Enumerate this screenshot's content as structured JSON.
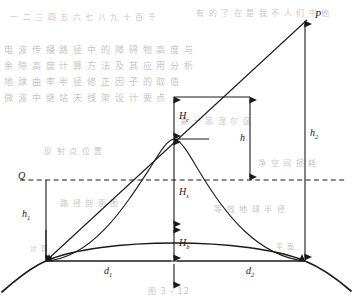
{
  "figure": {
    "type": "path-profile-diagram",
    "background_color": "#ffffff",
    "stroke_color": "#1a1a1a",
    "ghost_color": "#c8c6c4"
  },
  "labels": {
    "transmitter_apex": "P",
    "receiver_ref": "Q",
    "height_left": "h",
    "height_left_sub": "1",
    "height_right": "h",
    "height_right_sub": "2",
    "clearance": "H",
    "clearance_sub": "c",
    "sight_height": "H",
    "sight_height_sub": "s",
    "bulge_height": "H",
    "bulge_height_sub": "b",
    "obstacle_gap": "h",
    "distance_left": "d",
    "distance_left_sub": "1",
    "distance_right": "d",
    "distance_right_sub": "2"
  },
  "geometry": {
    "left_terminal": [
      46,
      261
    ],
    "right_terminal": [
      305,
      261
    ],
    "apex_p": [
      307,
      18
    ],
    "q_point": [
      46,
      180
    ],
    "center_x": 174,
    "terrain_peak": [
      174,
      139
    ],
    "bulge_peak": [
      174,
      227
    ],
    "dashed_line_y": 180,
    "bracket_x": 250,
    "bracket_top_y": 97,
    "los_tick_y": 97
  },
  "background_text": {
    "rows": [
      {
        "text": "一 二 三 四 五 六 七 八 九 十 百 千",
        "x": 10,
        "y": 14,
        "size": 8
      },
      {
        "text": "有 的 了 在 是 我 不 人 们 中 他",
        "x": 196,
        "y": 10,
        "size": 8
      },
      {
        "text": "电 波 传 播 路 径 中 的 障 碍 物 高 度 与",
        "x": 4,
        "y": 46,
        "size": 9
      },
      {
        "text": "余 隙 高 度 计 算 方 法 及 其 应 用 分 析",
        "x": 4,
        "y": 62,
        "size": 9
      },
      {
        "text": "地 球 曲 率 半 径 修 正 因 子 的 取 值",
        "x": 4,
        "y": 78,
        "size": 9
      },
      {
        "text": "微 波 中 继 站 天 线 架 设 计 要 点",
        "x": 4,
        "y": 94,
        "size": 9
      },
      {
        "text": "第 一 菲 涅 尔 区",
        "x": 180,
        "y": 118,
        "size": 8
      },
      {
        "text": "反 射 点 位 置",
        "x": 44,
        "y": 148,
        "size": 8
      },
      {
        "text": "净 空 间 损 耗",
        "x": 258,
        "y": 160,
        "size": 8
      },
      {
        "text": "路 径 剖 面 图",
        "x": 60,
        "y": 200,
        "size": 8
      },
      {
        "text": "等 效 地 球 半 径",
        "x": 214,
        "y": 206,
        "size": 8
      },
      {
        "text": "图 3 - 12",
        "x": 148,
        "y": 288,
        "size": 8
      },
      {
        "text": "计 算",
        "x": 30,
        "y": 246,
        "size": 7
      },
      {
        "text": "平 面",
        "x": 276,
        "y": 244,
        "size": 7
      }
    ]
  }
}
